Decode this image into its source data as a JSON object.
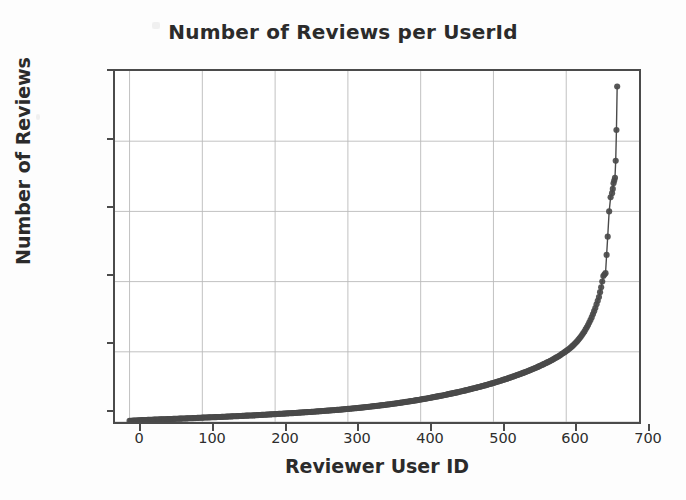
{
  "chart_data": {
    "type": "scatter",
    "title": "Number of Reviews per UserId",
    "xlabel": "Reviewer User ID",
    "ylabel": "Number of Reviews",
    "xlim": [
      -20,
      700
    ],
    "ylim": [
      0,
      2500
    ],
    "xticks": [
      0,
      100,
      200,
      300,
      400,
      500,
      600,
      700
    ],
    "yticks": [
      0,
      500,
      1000,
      1500,
      2000,
      2500
    ],
    "grid": true,
    "legend": null,
    "marker_color": "#4a4a4a",
    "line_color": "#4a4a4a",
    "series": [
      {
        "name": "Reviews per user (sorted ascending)",
        "x": [
          0,
          10,
          20,
          30,
          40,
          50,
          60,
          70,
          80,
          90,
          100,
          110,
          120,
          130,
          140,
          150,
          160,
          170,
          180,
          190,
          200,
          210,
          220,
          230,
          240,
          250,
          260,
          270,
          280,
          290,
          300,
          310,
          320,
          330,
          340,
          350,
          360,
          370,
          380,
          390,
          400,
          410,
          420,
          430,
          440,
          450,
          460,
          470,
          480,
          490,
          500,
          510,
          520,
          530,
          540,
          550,
          560,
          570,
          580,
          590,
          600,
          605,
          610,
          615,
          620,
          625,
          630,
          635,
          640,
          645,
          648,
          651,
          654,
          657,
          659,
          661,
          663,
          664,
          665,
          666,
          667,
          668,
          669,
          670
        ],
        "y": [
          8,
          11,
          14,
          16,
          18,
          20,
          22,
          24,
          26,
          28,
          31,
          33,
          35,
          37,
          40,
          42,
          45,
          47,
          50,
          53,
          56,
          59,
          62,
          65,
          69,
          72,
          76,
          80,
          84,
          88,
          93,
          98,
          103,
          109,
          115,
          121,
          128,
          135,
          143,
          151,
          160,
          169,
          179,
          189,
          200,
          211,
          223,
          236,
          249,
          263,
          278,
          294,
          311,
          329,
          348,
          368,
          390,
          414,
          440,
          470,
          505,
          525,
          548,
          575,
          607,
          645,
          690,
          745,
          812,
          890,
          960,
          1040,
          1060,
          1320,
          1500,
          1600,
          1630,
          1660,
          1700,
          1720,
          1740,
          1860,
          2080,
          2390
        ]
      }
    ]
  },
  "axes": {
    "ytick_labels": [
      "2500",
      "2000",
      "1500",
      "1000",
      "500",
      "0"
    ],
    "xtick_labels": [
      "0",
      "100",
      "200",
      "300",
      "400",
      "500",
      "600",
      "700"
    ]
  }
}
